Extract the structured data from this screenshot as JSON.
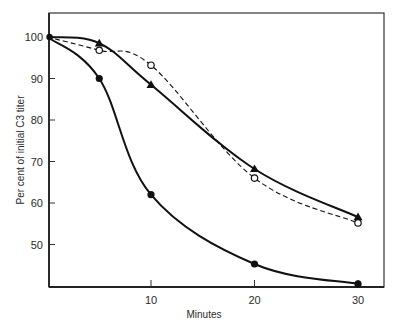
{
  "chart_data": {
    "type": "line",
    "title": "",
    "xlabel": "Minutes",
    "ylabel": "Per cent of initial C3 titer",
    "xlim": [
      0,
      32.5
    ],
    "ylim": [
      40,
      106
    ],
    "xticks": [
      10,
      20,
      30
    ],
    "xtick_labels": [
      "10",
      "20",
      "30"
    ],
    "yticks": [
      50,
      60,
      70,
      80,
      90,
      100
    ],
    "ytick_labels": [
      "50",
      "60",
      "70",
      "80",
      "90",
      "100"
    ],
    "grid": false,
    "legend": "none",
    "series": [
      {
        "name": "filled-circles",
        "marker": "filled-circle",
        "line": "solid",
        "x": [
          0,
          5,
          10,
          20,
          30
        ],
        "y": [
          100,
          90,
          62,
          45.3,
          40.5
        ]
      },
      {
        "name": "filled-triangles",
        "marker": "filled-triangle",
        "line": "solid",
        "x": [
          0,
          5,
          10,
          20,
          30
        ],
        "y": [
          100,
          98.5,
          88.5,
          68.2,
          56.6
        ]
      },
      {
        "name": "open-circles",
        "marker": "open-circle",
        "line": "dashed",
        "x": [
          0,
          5,
          10,
          20,
          30
        ],
        "y": [
          100,
          96.8,
          93.2,
          66,
          55.2
        ]
      }
    ]
  }
}
